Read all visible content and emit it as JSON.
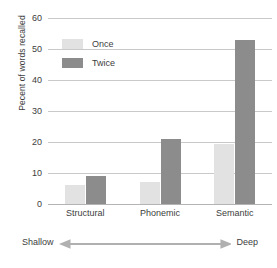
{
  "chart_data": {
    "type": "bar",
    "title": "",
    "subtitle": "",
    "xlabel": "",
    "ylabel": "Pecent of words recalled",
    "categories": [
      "Structural",
      "Phonemic",
      "Semantic"
    ],
    "series": [
      {
        "name": "Once",
        "values": [
          6,
          7,
          19.5
        ],
        "color": "#e2e2e2"
      },
      {
        "name": "Twice",
        "values": [
          9,
          21,
          53
        ],
        "color": "#8c8c8c"
      }
    ],
    "ylim": [
      0,
      60
    ],
    "yticks": [
      0,
      10,
      20,
      30,
      40,
      50,
      60
    ],
    "ytick_labels": [
      "0",
      "10",
      "20",
      "30",
      "40",
      "50",
      "60"
    ],
    "grid": "horizontal",
    "legend_position": "top-left-inside",
    "annotations": {
      "left_label": "Shallow",
      "right_label": "Deep",
      "arrow": "double-headed-horizontal-arrow"
    }
  },
  "axis": {
    "y_title": "Pecent of words recalled"
  },
  "legend": {
    "items": [
      {
        "label": "Once",
        "swatch": "legend-swatch-once"
      },
      {
        "label": "Twice",
        "swatch": "legend-swatch-twice"
      }
    ]
  },
  "colors": {
    "once": "#e2e2e2",
    "twice": "#8c8c8c",
    "gridline": "#c9c9c9",
    "text": "#3d3d3d",
    "background": "#ffffff"
  }
}
